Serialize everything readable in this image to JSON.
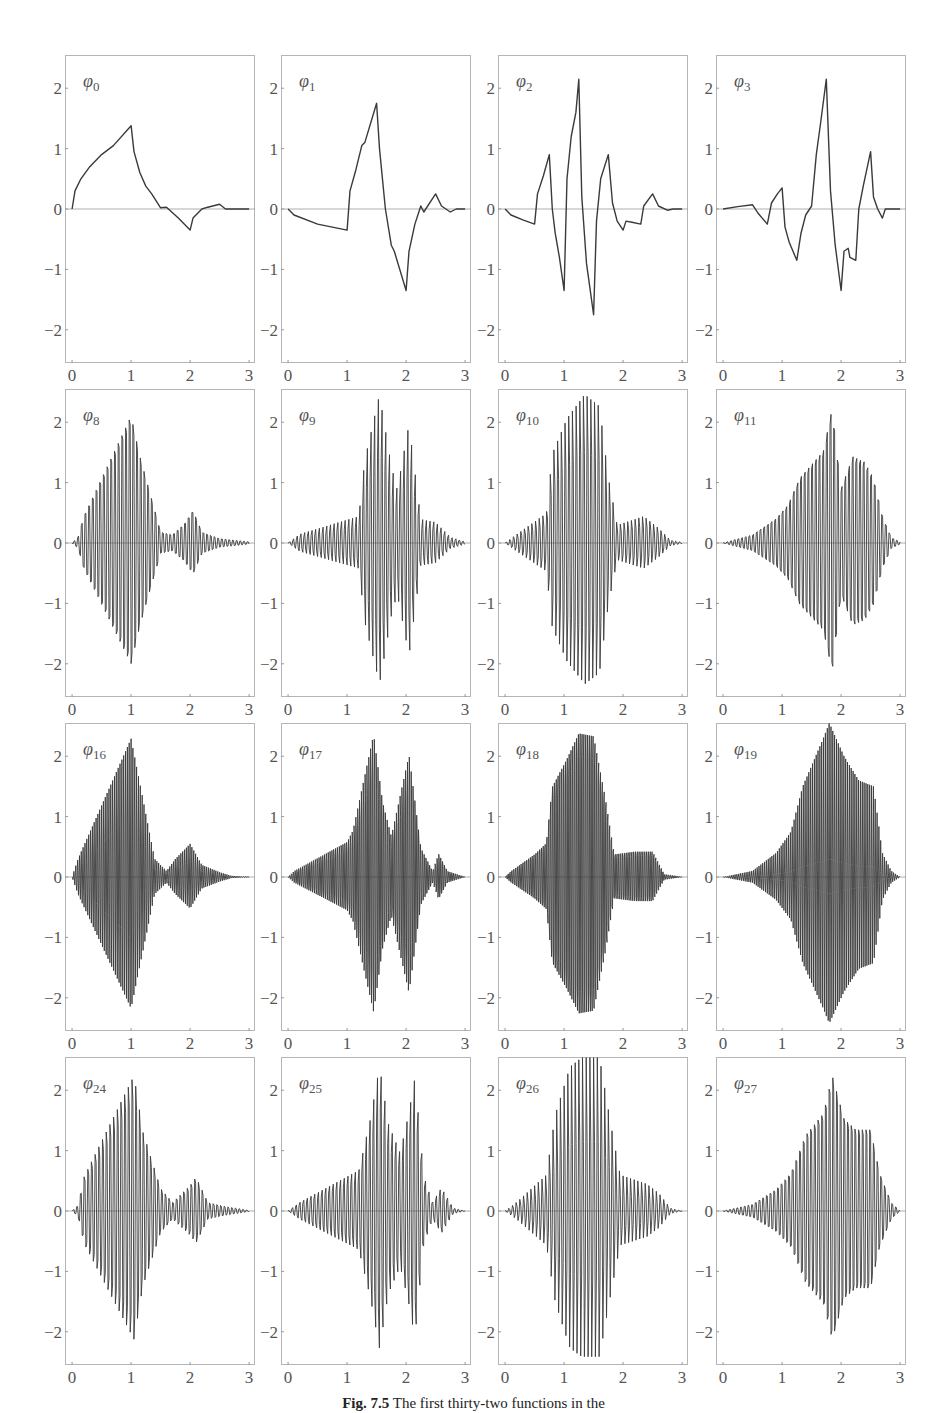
{
  "caption": {
    "label": "Fig. 7.5",
    "text": "The first thirty-two functions in the"
  },
  "colors": {
    "line": "#3a3a3a",
    "axis": "#9a9a9a",
    "frame": "#b5b5b5",
    "text": "#555555"
  },
  "chart_data": {
    "type": "line",
    "layout": {
      "rows": 4,
      "cols": 4
    },
    "xlim": [
      -0.12,
      3.1
    ],
    "ylim": [
      -2.55,
      2.55
    ],
    "xticks": [
      "0",
      "1",
      "2",
      "3"
    ],
    "yticks": [
      "2",
      "1",
      "0",
      "−1",
      "−2"
    ],
    "panels": [
      {
        "label": "φ",
        "sub": "0",
        "points": [
          [
            0,
            0
          ],
          [
            0.05,
            0.3
          ],
          [
            0.15,
            0.5
          ],
          [
            0.3,
            0.7
          ],
          [
            0.5,
            0.9
          ],
          [
            0.7,
            1.05
          ],
          [
            1.0,
            1.38
          ],
          [
            1.05,
            0.95
          ],
          [
            1.15,
            0.6
          ],
          [
            1.25,
            0.38
          ],
          [
            1.35,
            0.25
          ],
          [
            1.5,
            0.02
          ],
          [
            1.6,
            0.03
          ],
          [
            1.8,
            -0.15
          ],
          [
            2.0,
            -0.35
          ],
          [
            2.05,
            -0.15
          ],
          [
            2.2,
            0.0
          ],
          [
            2.3,
            0.03
          ],
          [
            2.5,
            0.08
          ],
          [
            2.6,
            0.0
          ],
          [
            2.8,
            0.0
          ],
          [
            3.0,
            0.0
          ]
        ]
      },
      {
        "label": "φ",
        "sub": "1",
        "points": [
          [
            0,
            0
          ],
          [
            0.1,
            -0.1
          ],
          [
            0.5,
            -0.25
          ],
          [
            1.0,
            -0.35
          ],
          [
            1.05,
            0.3
          ],
          [
            1.15,
            0.65
          ],
          [
            1.25,
            1.05
          ],
          [
            1.3,
            1.1
          ],
          [
            1.5,
            1.75
          ],
          [
            1.55,
            1.0
          ],
          [
            1.65,
            0.0
          ],
          [
            1.75,
            -0.6
          ],
          [
            1.8,
            -0.7
          ],
          [
            2.0,
            -1.35
          ],
          [
            2.05,
            -0.7
          ],
          [
            2.15,
            -0.25
          ],
          [
            2.25,
            0.05
          ],
          [
            2.3,
            -0.05
          ],
          [
            2.5,
            0.25
          ],
          [
            2.6,
            0.05
          ],
          [
            2.75,
            -0.05
          ],
          [
            2.85,
            0.0
          ],
          [
            3.0,
            0.0
          ]
        ]
      },
      {
        "label": "φ",
        "sub": "2",
        "points": [
          [
            0,
            0
          ],
          [
            0.1,
            -0.1
          ],
          [
            0.3,
            -0.18
          ],
          [
            0.5,
            -0.25
          ],
          [
            0.55,
            0.25
          ],
          [
            0.65,
            0.55
          ],
          [
            0.75,
            0.9
          ],
          [
            0.8,
            0.0
          ],
          [
            0.85,
            -0.4
          ],
          [
            0.92,
            -0.8
          ],
          [
            1.0,
            -1.35
          ],
          [
            1.05,
            0.5
          ],
          [
            1.12,
            1.2
          ],
          [
            1.2,
            1.6
          ],
          [
            1.25,
            2.15
          ],
          [
            1.3,
            0.2
          ],
          [
            1.38,
            -0.9
          ],
          [
            1.5,
            -1.75
          ],
          [
            1.55,
            -0.2
          ],
          [
            1.62,
            0.5
          ],
          [
            1.75,
            0.9
          ],
          [
            1.82,
            0.1
          ],
          [
            1.9,
            -0.2
          ],
          [
            2.0,
            -0.35
          ],
          [
            2.05,
            -0.2
          ],
          [
            2.15,
            -0.22
          ],
          [
            2.3,
            -0.25
          ],
          [
            2.35,
            0.05
          ],
          [
            2.5,
            0.25
          ],
          [
            2.6,
            0.05
          ],
          [
            2.75,
            -0.02
          ],
          [
            2.85,
            0.0
          ],
          [
            3.0,
            0.0
          ]
        ]
      },
      {
        "label": "φ",
        "sub": "3",
        "points": [
          [
            0,
            0
          ],
          [
            0.25,
            0.04
          ],
          [
            0.5,
            0.07
          ],
          [
            0.6,
            -0.08
          ],
          [
            0.75,
            -0.25
          ],
          [
            0.82,
            0.1
          ],
          [
            0.92,
            0.25
          ],
          [
            1.0,
            0.35
          ],
          [
            1.05,
            -0.3
          ],
          [
            1.12,
            -0.55
          ],
          [
            1.25,
            -0.85
          ],
          [
            1.32,
            -0.4
          ],
          [
            1.4,
            -0.1
          ],
          [
            1.5,
            0.05
          ],
          [
            1.58,
            0.9
          ],
          [
            1.65,
            1.4
          ],
          [
            1.75,
            2.15
          ],
          [
            1.82,
            0.3
          ],
          [
            1.9,
            -0.6
          ],
          [
            2.0,
            -1.35
          ],
          [
            2.05,
            -0.7
          ],
          [
            2.12,
            -0.65
          ],
          [
            2.15,
            -0.8
          ],
          [
            2.25,
            -0.85
          ],
          [
            2.3,
            0.0
          ],
          [
            2.38,
            0.4
          ],
          [
            2.5,
            0.95
          ],
          [
            2.55,
            0.2
          ],
          [
            2.62,
            0.0
          ],
          [
            2.7,
            -0.15
          ],
          [
            2.75,
            0.0
          ],
          [
            2.85,
            0.0
          ],
          [
            3.0,
            0.0
          ]
        ]
      },
      {
        "label": "φ",
        "sub": "8",
        "envelope": [
          [
            0,
            0
          ],
          [
            0.1,
            0.1
          ],
          [
            0.2,
            0.5
          ],
          [
            1.0,
            2.35
          ],
          [
            1.15,
            1.6
          ],
          [
            1.5,
            0.2
          ],
          [
            1.7,
            0.15
          ],
          [
            1.9,
            0.35
          ],
          [
            2.05,
            0.6
          ],
          [
            2.2,
            0.2
          ],
          [
            2.5,
            0.08
          ],
          [
            3.0,
            0.02
          ]
        ],
        "freq": 16
      },
      {
        "label": "φ",
        "sub": "9",
        "envelope": [
          [
            0,
            0
          ],
          [
            0.2,
            0.15
          ],
          [
            1.2,
            0.45
          ],
          [
            1.3,
            1.4
          ],
          [
            1.55,
            2.5
          ],
          [
            1.75,
            1.3
          ],
          [
            1.85,
            0.9
          ],
          [
            2.05,
            2.0
          ],
          [
            2.25,
            0.4
          ],
          [
            2.5,
            0.35
          ],
          [
            2.75,
            0.1
          ],
          [
            3.0,
            0.02
          ]
        ],
        "freq": 16
      },
      {
        "label": "φ",
        "sub": "10",
        "envelope": [
          [
            0,
            0
          ],
          [
            0.2,
            0.15
          ],
          [
            0.7,
            0.5
          ],
          [
            0.8,
            1.5
          ],
          [
            1.05,
            2.1
          ],
          [
            1.35,
            2.5
          ],
          [
            1.6,
            2.3
          ],
          [
            1.75,
            1.1
          ],
          [
            1.9,
            0.3
          ],
          [
            2.35,
            0.45
          ],
          [
            2.6,
            0.25
          ],
          [
            2.8,
            0.05
          ],
          [
            3.0,
            0.01
          ]
        ],
        "freq": 16
      },
      {
        "label": "φ",
        "sub": "11",
        "envelope": [
          [
            0,
            0
          ],
          [
            0.5,
            0.15
          ],
          [
            0.9,
            0.45
          ],
          [
            1.1,
            0.7
          ],
          [
            1.3,
            1.2
          ],
          [
            1.7,
            1.7
          ],
          [
            1.85,
            2.5
          ],
          [
            2.0,
            1.0
          ],
          [
            2.2,
            1.6
          ],
          [
            2.4,
            1.5
          ],
          [
            2.55,
            1.2
          ],
          [
            2.7,
            0.5
          ],
          [
            2.85,
            0.1
          ],
          [
            3.0,
            0.02
          ]
        ],
        "freq": 16
      },
      {
        "label": "φ",
        "sub": "16",
        "envelope": [
          [
            0,
            0
          ],
          [
            0.1,
            0.3
          ],
          [
            1.0,
            2.3
          ],
          [
            1.2,
            1.3
          ],
          [
            1.4,
            0.3
          ],
          [
            1.6,
            0.1
          ],
          [
            1.75,
            0.3
          ],
          [
            2.0,
            0.55
          ],
          [
            2.2,
            0.2
          ],
          [
            2.5,
            0.08
          ],
          [
            2.7,
            0.02
          ],
          [
            3.0,
            0.0
          ]
        ],
        "freq": 32
      },
      {
        "label": "φ",
        "sub": "17",
        "envelope": [
          [
            0,
            0
          ],
          [
            0.1,
            0.1
          ],
          [
            1.0,
            0.6
          ],
          [
            1.1,
            0.8
          ],
          [
            1.45,
            2.45
          ],
          [
            1.6,
            1.3
          ],
          [
            1.75,
            0.7
          ],
          [
            2.05,
            2.1
          ],
          [
            2.25,
            0.5
          ],
          [
            2.45,
            0.1
          ],
          [
            2.55,
            0.4
          ],
          [
            2.7,
            0.1
          ],
          [
            3.0,
            0.0
          ]
        ],
        "freq": 32
      },
      {
        "label": "φ",
        "sub": "18",
        "envelope": [
          [
            0,
            0
          ],
          [
            0.1,
            0.1
          ],
          [
            0.5,
            0.4
          ],
          [
            0.7,
            0.6
          ],
          [
            0.8,
            1.6
          ],
          [
            1.05,
            2.1
          ],
          [
            1.25,
            2.55
          ],
          [
            1.5,
            2.5
          ],
          [
            1.7,
            1.4
          ],
          [
            1.85,
            0.4
          ],
          [
            2.2,
            0.45
          ],
          [
            2.5,
            0.45
          ],
          [
            2.7,
            0.05
          ],
          [
            3.0,
            0.0
          ]
        ],
        "freq": 32
      },
      {
        "label": "φ",
        "sub": "19",
        "envelope": [
          [
            0,
            0
          ],
          [
            0.5,
            0.1
          ],
          [
            0.9,
            0.4
          ],
          [
            1.15,
            0.75
          ],
          [
            1.35,
            1.5
          ],
          [
            1.7,
            2.3
          ],
          [
            1.8,
            2.55
          ],
          [
            2.05,
            2.0
          ],
          [
            2.3,
            1.6
          ],
          [
            2.55,
            1.5
          ],
          [
            2.7,
            0.4
          ],
          [
            2.85,
            0.1
          ],
          [
            3.0,
            0.0
          ]
        ],
        "freq": 32
      },
      {
        "label": "φ",
        "sub": "24",
        "envelope": [
          [
            0,
            0
          ],
          [
            0.1,
            0.1
          ],
          [
            0.2,
            0.6
          ],
          [
            1.05,
            2.4
          ],
          [
            1.2,
            1.4
          ],
          [
            1.5,
            0.4
          ],
          [
            1.7,
            0.15
          ],
          [
            2.0,
            0.45
          ],
          [
            2.1,
            0.6
          ],
          [
            2.3,
            0.15
          ],
          [
            2.6,
            0.08
          ],
          [
            3.0,
            0.01
          ]
        ],
        "freq": 16
      },
      {
        "label": "φ",
        "sub": "25",
        "envelope": [
          [
            0,
            0
          ],
          [
            0.2,
            0.15
          ],
          [
            1.2,
            0.7
          ],
          [
            1.4,
            1.6
          ],
          [
            1.55,
            2.5
          ],
          [
            1.7,
            1.5
          ],
          [
            1.9,
            1.0
          ],
          [
            2.05,
            1.7
          ],
          [
            2.15,
            2.3
          ],
          [
            2.3,
            0.6
          ],
          [
            2.45,
            0.15
          ],
          [
            2.6,
            0.4
          ],
          [
            2.8,
            0.05
          ],
          [
            3.0,
            0.0
          ]
        ],
        "freq": 16
      },
      {
        "label": "φ",
        "sub": "26",
        "envelope": [
          [
            0,
            0
          ],
          [
            0.2,
            0.15
          ],
          [
            0.7,
            0.6
          ],
          [
            0.85,
            1.6
          ],
          [
            1.1,
            2.4
          ],
          [
            1.3,
            2.55
          ],
          [
            1.6,
            2.55
          ],
          [
            1.8,
            1.4
          ],
          [
            1.95,
            0.6
          ],
          [
            2.4,
            0.45
          ],
          [
            2.6,
            0.3
          ],
          [
            2.8,
            0.05
          ],
          [
            3.0,
            0.0
          ]
        ],
        "freq": 16
      },
      {
        "label": "φ",
        "sub": "27",
        "envelope": [
          [
            0,
            0
          ],
          [
            0.5,
            0.12
          ],
          [
            0.9,
            0.4
          ],
          [
            1.15,
            0.7
          ],
          [
            1.4,
            1.4
          ],
          [
            1.7,
            1.8
          ],
          [
            1.85,
            2.5
          ],
          [
            2.05,
            1.7
          ],
          [
            2.25,
            1.5
          ],
          [
            2.5,
            1.5
          ],
          [
            2.65,
            0.7
          ],
          [
            2.85,
            0.15
          ],
          [
            3.0,
            0.0
          ]
        ],
        "freq": 16
      }
    ]
  }
}
